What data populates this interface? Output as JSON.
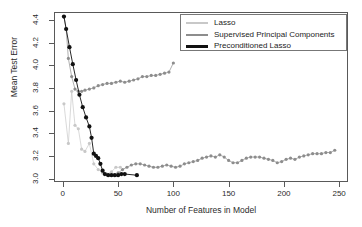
{
  "chart_data": {
    "type": "line",
    "title": "",
    "xlabel": "Number of Features in Model",
    "ylabel": "Mean Test Error",
    "xlim": [
      -8,
      258
    ],
    "ylim": [
      2.97,
      4.47
    ],
    "xticks": [
      0,
      50,
      100,
      150,
      200,
      250
    ],
    "yticks": [
      "3.0",
      "3.2",
      "3.4",
      "3.6",
      "3.8",
      "4.0",
      "4.2",
      "4.4"
    ],
    "ytick_values": [
      3.0,
      3.2,
      3.4,
      3.6,
      3.8,
      4.0,
      4.2,
      4.4
    ],
    "grid": false,
    "legend_position": "top-right",
    "markers": "filled-circle",
    "series": [
      {
        "name": "Lasso",
        "color": "#c8c8c8",
        "points": [
          [
            1,
            3.66
          ],
          [
            5,
            3.31
          ],
          [
            8,
            3.77
          ],
          [
            11,
            3.47
          ],
          [
            14,
            3.44
          ],
          [
            17,
            3.26
          ],
          [
            20,
            3.24
          ],
          [
            24,
            3.31
          ],
          [
            28,
            3.13
          ],
          [
            32,
            3.08
          ],
          [
            36,
            3.05
          ],
          [
            40,
            3.04
          ],
          [
            44,
            3.06
          ],
          [
            48,
            3.1
          ],
          [
            52,
            3.1
          ]
        ]
      },
      {
        "name": "Supervised Principal Components",
        "color": "#8d8d8d",
        "points": [
          [
            1,
            4.43
          ],
          [
            3,
            4.32
          ],
          [
            5,
            4.06
          ],
          [
            8,
            3.9
          ],
          [
            11,
            3.79
          ],
          [
            14,
            3.77
          ],
          [
            17,
            3.77
          ],
          [
            20,
            3.78
          ],
          [
            24,
            3.79
          ],
          [
            28,
            3.8
          ],
          [
            32,
            3.82
          ],
          [
            36,
            3.83
          ],
          [
            40,
            3.84
          ],
          [
            44,
            3.84
          ],
          [
            48,
            3.85
          ],
          [
            52,
            3.86
          ],
          [
            56,
            3.85
          ],
          [
            60,
            3.86
          ],
          [
            64,
            3.87
          ],
          [
            68,
            3.88
          ],
          [
            72,
            3.9
          ],
          [
            76,
            3.9
          ],
          [
            80,
            3.91
          ],
          [
            84,
            3.91
          ],
          [
            88,
            3.92
          ],
          [
            92,
            3.93
          ],
          [
            96,
            3.94
          ],
          [
            100,
            4.02
          ],
          [
            50,
            3.05
          ],
          [
            54,
            3.08
          ],
          [
            58,
            3.1
          ],
          [
            62,
            3.12
          ],
          [
            66,
            3.13
          ],
          [
            70,
            3.13
          ],
          [
            74,
            3.12
          ],
          [
            78,
            3.11
          ],
          [
            82,
            3.1
          ],
          [
            86,
            3.1
          ],
          [
            90,
            3.11
          ],
          [
            94,
            3.12
          ],
          [
            98,
            3.11
          ],
          [
            102,
            3.1
          ],
          [
            106,
            3.11
          ],
          [
            110,
            3.13
          ],
          [
            114,
            3.14
          ],
          [
            118,
            3.15
          ],
          [
            122,
            3.16
          ],
          [
            126,
            3.18
          ],
          [
            130,
            3.19
          ],
          [
            134,
            3.2
          ],
          [
            138,
            3.19
          ],
          [
            142,
            3.21
          ],
          [
            146,
            3.19
          ],
          [
            150,
            3.16
          ],
          [
            154,
            3.14
          ],
          [
            158,
            3.14
          ],
          [
            162,
            3.16
          ],
          [
            166,
            3.18
          ],
          [
            170,
            3.19
          ],
          [
            174,
            3.19
          ],
          [
            178,
            3.19
          ],
          [
            182,
            3.18
          ],
          [
            186,
            3.17
          ],
          [
            190,
            3.16
          ],
          [
            194,
            3.14
          ],
          [
            198,
            3.15
          ],
          [
            202,
            3.17
          ],
          [
            206,
            3.18
          ],
          [
            210,
            3.17
          ],
          [
            214,
            3.19
          ],
          [
            218,
            3.2
          ],
          [
            222,
            3.21
          ],
          [
            226,
            3.22
          ],
          [
            230,
            3.22
          ],
          [
            234,
            3.22
          ],
          [
            238,
            3.23
          ],
          [
            242,
            3.23
          ],
          [
            246,
            3.25
          ]
        ]
      },
      {
        "name": "Preconditioned Lasso",
        "color": "#111111",
        "points": [
          [
            1,
            4.43
          ],
          [
            3,
            4.32
          ],
          [
            6,
            4.16
          ],
          [
            9,
            4.01
          ],
          [
            12,
            3.87
          ],
          [
            15,
            3.74
          ],
          [
            18,
            3.63
          ],
          [
            21,
            3.54
          ],
          [
            24,
            3.46
          ],
          [
            26,
            3.36
          ],
          [
            28,
            3.22
          ],
          [
            30,
            3.2
          ],
          [
            32,
            3.18
          ],
          [
            34,
            3.13
          ],
          [
            36,
            3.07
          ],
          [
            38,
            3.04
          ],
          [
            41,
            3.03
          ],
          [
            44,
            3.03
          ],
          [
            47,
            3.03
          ],
          [
            50,
            3.03
          ],
          [
            53,
            3.04
          ],
          [
            56,
            3.04
          ],
          [
            67,
            3.03
          ]
        ]
      }
    ],
    "legend": [
      {
        "label": "Lasso",
        "color": "#c8c8c8"
      },
      {
        "label": "Supervised Principal Components",
        "color": "#8d8d8d"
      },
      {
        "label": "Preconditioned Lasso",
        "color": "#111111"
      }
    ]
  }
}
